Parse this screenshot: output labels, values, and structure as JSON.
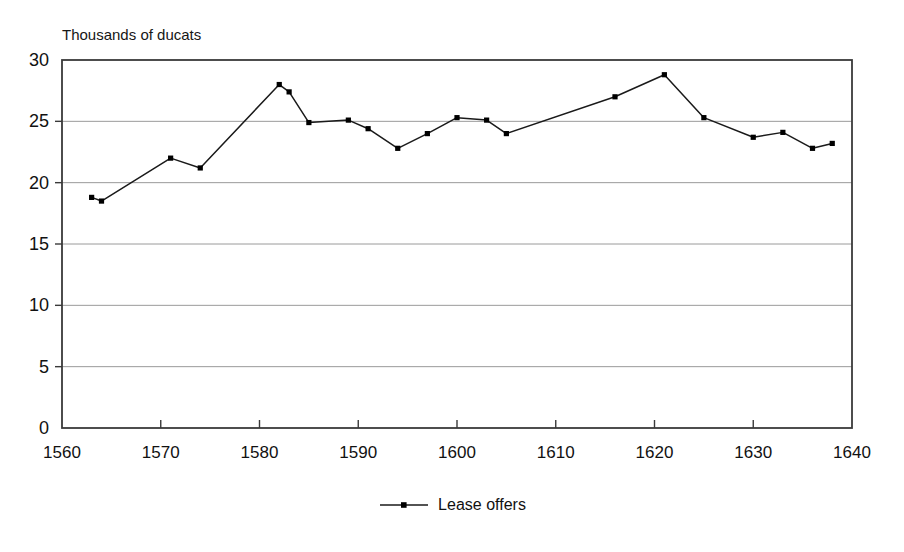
{
  "figure": {
    "title_remnant": "",
    "y_axis_label": "Thousands of ducats",
    "legend_label": "Lease offers",
    "legend_symbol_name": "line-with-marker"
  },
  "colors": {
    "line": "#1a1a1a",
    "marker": "#000000",
    "axis": "#3a3a3a",
    "gridline": "#9a9a9a",
    "background": "#ffffff",
    "text": "#111111"
  },
  "chart_data": {
    "type": "line",
    "title": "",
    "xlabel": "",
    "ylabel": "Thousands of ducats",
    "xlim": [
      1560,
      1640
    ],
    "ylim": [
      0,
      30
    ],
    "xticks": [
      1560,
      1570,
      1580,
      1590,
      1600,
      1610,
      1620,
      1630,
      1640
    ],
    "yticks": [
      0,
      5,
      10,
      15,
      20,
      25,
      30
    ],
    "xtick_labels": [
      "1560",
      "1570",
      "1580",
      "1590",
      "1600",
      "1610",
      "1620",
      "1630",
      "1640"
    ],
    "ytick_labels": [
      "0",
      "5",
      "10",
      "15",
      "20",
      "25",
      "30"
    ],
    "grid": "horizontal",
    "legend_position": "bottom-center",
    "series": [
      {
        "name": "Lease offers",
        "marker": "square",
        "x": [
          1563,
          1564,
          1571,
          1574,
          1582,
          1583,
          1585,
          1589,
          1591,
          1594,
          1597,
          1600,
          1603,
          1605,
          1616,
          1621,
          1625,
          1630,
          1633,
          1636,
          1638
        ],
        "values": [
          18.8,
          18.5,
          22.0,
          21.2,
          28.0,
          27.4,
          24.9,
          25.1,
          24.4,
          22.8,
          24.0,
          25.3,
          25.1,
          24.0,
          27.0,
          28.8,
          25.3,
          23.7,
          24.1,
          22.8,
          23.2
        ],
        "points": [
          {
            "x": 1563,
            "y": 18.8
          },
          {
            "x": 1564,
            "y": 18.5
          },
          {
            "x": 1571,
            "y": 22.0
          },
          {
            "x": 1574,
            "y": 21.2
          },
          {
            "x": 1582,
            "y": 28.0
          },
          {
            "x": 1583,
            "y": 27.4
          },
          {
            "x": 1585,
            "y": 24.9
          },
          {
            "x": 1589,
            "y": 25.1
          },
          {
            "x": 1591,
            "y": 24.4
          },
          {
            "x": 1594,
            "y": 22.8
          },
          {
            "x": 1597,
            "y": 24.0
          },
          {
            "x": 1600,
            "y": 25.3
          },
          {
            "x": 1603,
            "y": 25.1
          },
          {
            "x": 1605,
            "y": 24.0
          },
          {
            "x": 1616,
            "y": 27.0
          },
          {
            "x": 1621,
            "y": 28.8
          },
          {
            "x": 1625,
            "y": 25.3
          },
          {
            "x": 1630,
            "y": 23.7
          },
          {
            "x": 1633,
            "y": 24.1
          },
          {
            "x": 1636,
            "y": 22.8
          },
          {
            "x": 1638,
            "y": 23.2
          }
        ]
      }
    ]
  }
}
